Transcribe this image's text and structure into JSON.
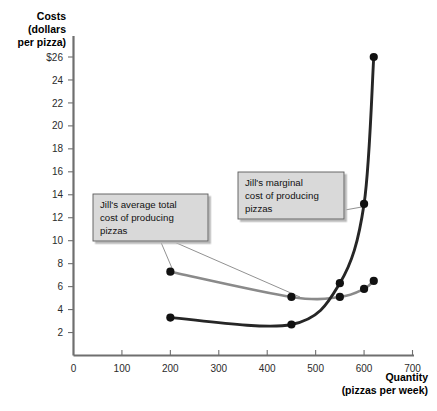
{
  "chart_data": {
    "type": "line",
    "title": "",
    "xlabel": "Quantity",
    "xlabel_sub": "(pizzas per week)",
    "ylabel": "Costs",
    "ylabel_sub1": "(dollars",
    "ylabel_sub2": "per pizza)",
    "xlim": [
      0,
      700
    ],
    "ylim": [
      0,
      27
    ],
    "grid": false,
    "legend_position": "annotations",
    "x_ticks": [
      0,
      100,
      200,
      300,
      400,
      500,
      600,
      700
    ],
    "x_tick_labels": [
      "0",
      "100",
      "200",
      "300",
      "400",
      "500",
      "600",
      "700"
    ],
    "y_ticks": [
      2,
      4,
      6,
      8,
      10,
      12,
      14,
      16,
      18,
      20,
      22,
      24,
      26
    ],
    "y_tick_labels": [
      "2",
      "4",
      "6",
      "8",
      "10",
      "12",
      "14",
      "16",
      "18",
      "20",
      "22",
      "24",
      "$26"
    ],
    "series": [
      {
        "name": "Jill's marginal cost of producing pizzas",
        "short_name": "marginal-cost",
        "color": "#262626",
        "x": [
          200,
          450,
          550,
          600,
          620
        ],
        "values": [
          3.3,
          2.7,
          6.3,
          13.2,
          26.0
        ]
      },
      {
        "name": "Jill's average total cost of producing pizzas",
        "short_name": "average-total-cost",
        "color": "#8a8a8a",
        "x": [
          200,
          450,
          550,
          600,
          620
        ],
        "values": [
          7.3,
          5.1,
          5.1,
          5.8,
          6.5
        ]
      }
    ],
    "annotations": [
      {
        "id": "atc-callout",
        "lines": [
          "Jill's average total",
          "cost of producing",
          "pizzas"
        ],
        "points_to_x": 200,
        "points_to_y": 7.3
      },
      {
        "id": "mc-callout",
        "lines": [
          "Jill's marginal",
          "cost of producing",
          "pizzas"
        ],
        "points_to_x": 600,
        "points_to_y": 13.2
      }
    ]
  }
}
